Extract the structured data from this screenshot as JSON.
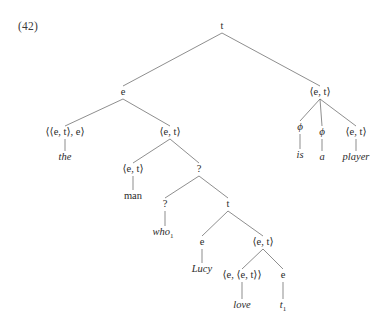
{
  "example": {
    "number": "(42)"
  },
  "diagram": {
    "kind": "semantic-type-tree",
    "sentence": "the man who1 Lucy love t1 is a player",
    "canvas": {
      "width": 385,
      "height": 329
    },
    "nodes": [
      {
        "id": "root",
        "label": "t",
        "x": 222,
        "y": 29,
        "style": "roman"
      },
      {
        "id": "dp",
        "label": "e",
        "x": 123,
        "y": 95,
        "style": "roman"
      },
      {
        "id": "vp",
        "label": "⟨e, t⟩",
        "x": 320,
        "y": 95,
        "style": "roman"
      },
      {
        "id": "det",
        "label": "⟨⟨e, t⟩, e⟩",
        "x": 65,
        "y": 135,
        "style": "roman"
      },
      {
        "id": "nbar",
        "label": "⟨e, t⟩",
        "x": 170,
        "y": 135,
        "style": "roman"
      },
      {
        "id": "cop",
        "label": "ϕ",
        "x": 300,
        "y": 130,
        "style": "phi"
      },
      {
        "id": "artphi",
        "label": "ϕ",
        "x": 322,
        "y": 135,
        "style": "phi"
      },
      {
        "id": "npred",
        "label": "⟨e, t⟩",
        "x": 356,
        "y": 135,
        "style": "roman"
      },
      {
        "id": "nhead",
        "label": "⟨e, t⟩",
        "x": 133,
        "y": 172,
        "style": "roman"
      },
      {
        "id": "relc",
        "label": "?",
        "x": 199,
        "y": 172,
        "style": "roman"
      },
      {
        "id": "relop",
        "label": "?",
        "x": 165,
        "y": 207,
        "style": "roman"
      },
      {
        "id": "irc",
        "label": "t",
        "x": 228,
        "y": 207,
        "style": "roman"
      },
      {
        "id": "subj",
        "label": "e",
        "x": 202,
        "y": 245,
        "style": "roman"
      },
      {
        "id": "vbar",
        "label": "⟨e, t⟩",
        "x": 263,
        "y": 245,
        "style": "roman"
      },
      {
        "id": "verb",
        "label": "⟨e, ⟨e, t⟩⟩",
        "x": 242,
        "y": 278,
        "style": "roman"
      },
      {
        "id": "obj",
        "label": "e",
        "x": 283,
        "y": 278,
        "style": "roman"
      }
    ],
    "edges": [
      {
        "from": "root",
        "to": "dp"
      },
      {
        "from": "root",
        "to": "vp"
      },
      {
        "from": "dp",
        "to": "det"
      },
      {
        "from": "dp",
        "to": "nbar"
      },
      {
        "from": "vp",
        "to": "cop"
      },
      {
        "from": "vp",
        "to": "artphi"
      },
      {
        "from": "vp",
        "to": "npred"
      },
      {
        "from": "nbar",
        "to": "nhead"
      },
      {
        "from": "nbar",
        "to": "relc"
      },
      {
        "from": "relc",
        "to": "relop"
      },
      {
        "from": "relc",
        "to": "irc"
      },
      {
        "from": "irc",
        "to": "subj"
      },
      {
        "from": "irc",
        "to": "vbar"
      },
      {
        "from": "vbar",
        "to": "verb"
      },
      {
        "from": "vbar",
        "to": "obj"
      }
    ],
    "leaves": [
      {
        "id": "leaf-the",
        "parent": "det",
        "text": "the",
        "sub": "",
        "x": 65,
        "y": 160,
        "style": "italic"
      },
      {
        "id": "leaf-man",
        "parent": "nhead",
        "text": "man",
        "sub": "",
        "x": 133,
        "y": 199,
        "style": "roman"
      },
      {
        "id": "leaf-who",
        "parent": "relop",
        "text": "who",
        "sub": "1",
        "x": 163,
        "y": 235,
        "style": "italic"
      },
      {
        "id": "leaf-lucy",
        "parent": "subj",
        "text": "Lucy",
        "sub": "",
        "x": 202,
        "y": 272,
        "style": "italic"
      },
      {
        "id": "leaf-love",
        "parent": "verb",
        "text": "love",
        "sub": "",
        "x": 242,
        "y": 308,
        "style": "italic"
      },
      {
        "id": "leaf-trace",
        "parent": "obj",
        "text": "t",
        "sub": "1",
        "x": 283,
        "y": 308,
        "style": "italic"
      },
      {
        "id": "leaf-is",
        "parent": "cop",
        "text": "is",
        "sub": "",
        "x": 300,
        "y": 158,
        "style": "italic"
      },
      {
        "id": "leaf-a",
        "parent": "artphi",
        "text": "a",
        "sub": "",
        "x": 322,
        "y": 160,
        "style": "italic"
      },
      {
        "id": "leaf-player",
        "parent": "npred",
        "text": "player",
        "sub": "",
        "x": 356,
        "y": 160,
        "style": "italic"
      }
    ],
    "colors": {
      "background": "#ffffff",
      "text": "#2b2b2b",
      "line": "#5d5d5d"
    }
  }
}
